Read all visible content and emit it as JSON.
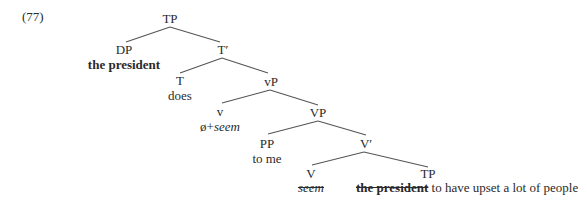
{
  "example_number": "(77)",
  "tree": {
    "nodes": [
      {
        "id": "TP",
        "label": "TP"
      },
      {
        "id": "DP",
        "label": "DP",
        "terminal": "the president",
        "terminal_style": "bold"
      },
      {
        "id": "Tbar",
        "label": "T′"
      },
      {
        "id": "T",
        "label": "T",
        "terminal": "does"
      },
      {
        "id": "vP",
        "label": "vP"
      },
      {
        "id": "v",
        "label": "v",
        "terminal_prefix": "ø+",
        "terminal": "seem",
        "terminal_style": "italic"
      },
      {
        "id": "VP",
        "label": "VP"
      },
      {
        "id": "PP",
        "label": "PP",
        "terminal": "to me"
      },
      {
        "id": "Vbar",
        "label": "V′"
      },
      {
        "id": "V",
        "label": "V",
        "terminal": "seem",
        "terminal_style": "italic strikethrough"
      },
      {
        "id": "TP2",
        "label": "TP",
        "terminal_struck": "the president",
        "terminal_rest": "to have upset a lot of people"
      }
    ],
    "edges": [
      [
        "TP",
        "DP"
      ],
      [
        "TP",
        "Tbar"
      ],
      [
        "Tbar",
        "T"
      ],
      [
        "Tbar",
        "vP"
      ],
      [
        "vP",
        "v"
      ],
      [
        "vP",
        "VP"
      ],
      [
        "VP",
        "PP"
      ],
      [
        "VP",
        "Vbar"
      ],
      [
        "Vbar",
        "V"
      ],
      [
        "Vbar",
        "TP2"
      ]
    ]
  }
}
